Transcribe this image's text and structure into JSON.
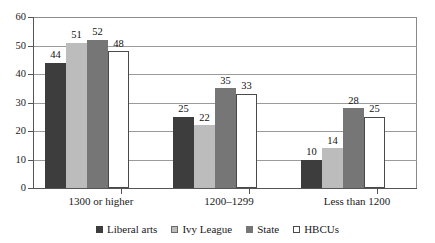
{
  "chart_data": {
    "type": "bar",
    "title": "",
    "subtitle": "",
    "xlabel": "",
    "ylabel": "",
    "categories": [
      "1300 or higher",
      "1200–1299",
      "Less than 1200"
    ],
    "series": [
      {
        "name": "Liberal arts",
        "color": "#3d3d3d",
        "values": [
          44,
          25,
          10
        ]
      },
      {
        "name": "Ivy League",
        "color": "#bcbcbc",
        "values": [
          51,
          22,
          14
        ]
      },
      {
        "name": "State",
        "color": "#767676",
        "values": [
          52,
          35,
          28
        ]
      },
      {
        "name": "HBCUs",
        "color": "#ffffff",
        "values": [
          48,
          33,
          25
        ]
      }
    ],
    "ylim": [
      0,
      60
    ],
    "yticks": [
      0,
      10,
      20,
      30,
      40,
      50,
      60
    ],
    "ytick_labels": [
      "0",
      "10",
      "20",
      "30",
      "40",
      "50",
      "60"
    ],
    "grid": "horizontal",
    "legend_position": "bottom",
    "show_value_labels": true
  },
  "legend": {
    "items": [
      {
        "label": "Liberal arts",
        "swatch": "liberal"
      },
      {
        "label": "Ivy League",
        "swatch": "ivy"
      },
      {
        "label": "State",
        "swatch": "state"
      },
      {
        "label": "HBCUs",
        "swatch": "hbcu"
      }
    ]
  }
}
